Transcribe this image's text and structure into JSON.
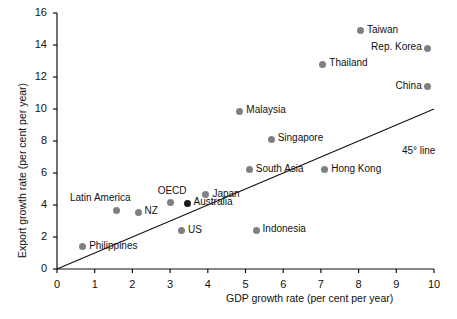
{
  "chart_data": {
    "type": "scatter",
    "title": "",
    "xlabel": "GDP growth rate (per cent per year)",
    "ylabel": "Export growth rate (per cent per year)",
    "xlim": [
      0,
      10
    ],
    "ylim": [
      0,
      16
    ],
    "xticks": [
      0,
      1,
      2,
      3,
      4,
      5,
      6,
      7,
      8,
      9,
      10
    ],
    "yticks": [
      0,
      2,
      4,
      6,
      8,
      10,
      12,
      14,
      16
    ],
    "grid": false,
    "legend": "none",
    "annotations": [
      {
        "text": "45° line",
        "x": 9.15,
        "y": 7.3
      }
    ],
    "reference_line": {
      "name": "45-degree-line",
      "from": [
        0,
        0
      ],
      "to": [
        10,
        10
      ],
      "color": "#111111"
    },
    "points": [
      {
        "label": "Taiwan",
        "x": 8.05,
        "y": 14.9,
        "color": "#808080",
        "label_side": "right"
      },
      {
        "label": "Rep. Korea",
        "x": 9.82,
        "y": 13.8,
        "color": "#808080",
        "label_side": "left"
      },
      {
        "label": "Thailand",
        "x": 7.05,
        "y": 12.8,
        "color": "#808080",
        "label_side": "right"
      },
      {
        "label": "China",
        "x": 9.82,
        "y": 11.4,
        "color": "#808080",
        "label_side": "left"
      },
      {
        "label": "Malaysia",
        "x": 4.85,
        "y": 9.85,
        "color": "#808080",
        "label_side": "right"
      },
      {
        "label": "Singapore",
        "x": 5.68,
        "y": 8.1,
        "color": "#808080",
        "label_side": "right"
      },
      {
        "label": "South Asia",
        "x": 5.1,
        "y": 6.2,
        "color": "#808080",
        "label_side": "right"
      },
      {
        "label": "Hong Kong",
        "x": 7.1,
        "y": 6.2,
        "color": "#808080",
        "label_side": "right"
      },
      {
        "label": "Japan",
        "x": 3.95,
        "y": 4.65,
        "color": "#808080",
        "label_side": "right"
      },
      {
        "label": "OECD",
        "x": 3.0,
        "y": 4.15,
        "color": "#808080",
        "label_side": "above"
      },
      {
        "label": "Australia",
        "x": 3.45,
        "y": 4.1,
        "color": "#1a1a1a",
        "label_side": "right"
      },
      {
        "label": "Latin America",
        "x": 1.58,
        "y": 3.68,
        "color": "#808080",
        "label_side": "above-left"
      },
      {
        "label": "NZ",
        "x": 2.15,
        "y": 3.55,
        "color": "#808080",
        "label_side": "right"
      },
      {
        "label": "US",
        "x": 3.3,
        "y": 2.4,
        "color": "#808080",
        "label_side": "right"
      },
      {
        "label": "Indonesia",
        "x": 5.28,
        "y": 2.42,
        "color": "#808080",
        "label_side": "right"
      },
      {
        "label": "Philippines",
        "x": 0.68,
        "y": 1.38,
        "color": "#808080",
        "label_side": "right"
      }
    ]
  },
  "axes": {
    "x_title": "GDP growth rate (per cent per year)",
    "y_title": "Export growth rate (per cent per year)",
    "x_tick_labels": [
      "0",
      "1",
      "2",
      "3",
      "4",
      "5",
      "6",
      "7",
      "8",
      "9",
      "10"
    ],
    "y_tick_labels": [
      "0",
      "2",
      "4",
      "6",
      "8",
      "10",
      "12",
      "14",
      "16"
    ]
  },
  "colors": {
    "marker": "#808080",
    "marker_highlight": "#1a1a1a",
    "axis": "#111111",
    "background": "#ffffff"
  }
}
